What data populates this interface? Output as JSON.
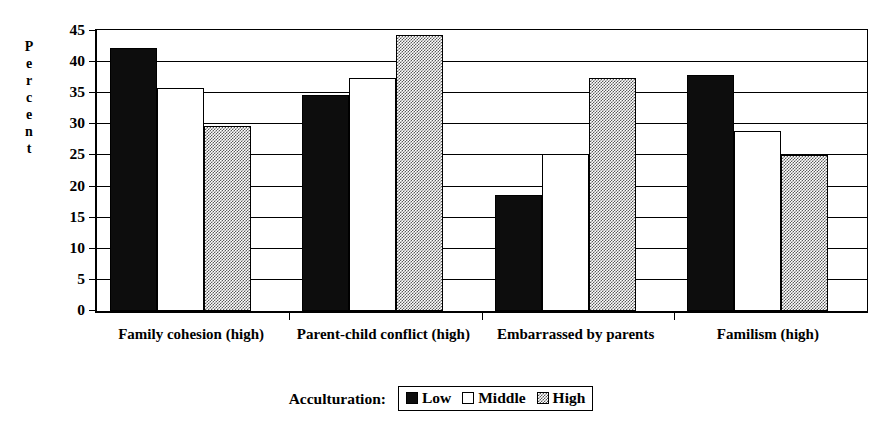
{
  "chart_data": {
    "type": "bar",
    "title": "",
    "subtitle": "",
    "xlabel": "",
    "ylabel": "Percent",
    "ylim": [
      0,
      45
    ],
    "ytick_interval": 5,
    "yticks": [
      0,
      5,
      10,
      15,
      20,
      25,
      30,
      35,
      40,
      45
    ],
    "ytick_labels": [
      "0",
      "5",
      "10",
      "15",
      "20",
      "25",
      "30",
      "35",
      "40",
      "45"
    ],
    "grid": true,
    "grid_axis": "y",
    "legend_position": "bottom-center",
    "legend_title": "Acculturation:",
    "categories": [
      "Family cohesion (high)",
      "Parent-child conflict (high)",
      "Embarrassed by parents",
      "Familism (high)"
    ],
    "series": [
      {
        "name": "Low",
        "fill": "solid-black",
        "color": "#0d0d0d",
        "values": [
          42.3,
          34.7,
          18.6,
          38.0
        ]
      },
      {
        "name": "Middle",
        "fill": "white",
        "color": "#ffffff",
        "values": [
          35.8,
          37.5,
          25.3,
          28.9
        ]
      },
      {
        "name": "High",
        "fill": "gray-dither",
        "color": "#808080",
        "values": [
          29.8,
          44.3,
          37.5,
          25.0
        ]
      }
    ],
    "annotations": []
  },
  "yaxis": {
    "title_letters": [
      "P",
      "e",
      "r",
      "c",
      "e",
      "n",
      "t"
    ]
  },
  "legend": {
    "title": "Acculturation:",
    "entries": [
      {
        "label": "Low"
      },
      {
        "label": "Middle"
      },
      {
        "label": "High"
      }
    ]
  },
  "colors": {
    "axis": "#000000",
    "grid": "#000000",
    "background": "#ffffff",
    "series_low": "#0d0d0d",
    "series_middle": "#ffffff",
    "series_high": "#808080"
  }
}
